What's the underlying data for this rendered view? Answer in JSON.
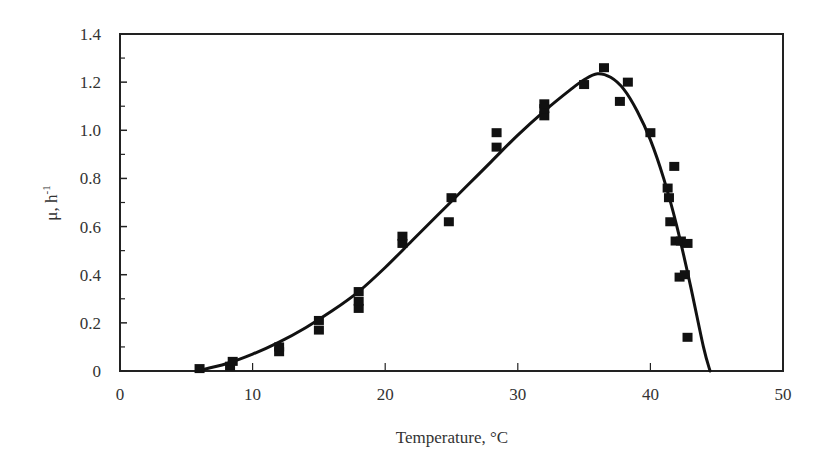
{
  "chart_data": {
    "type": "scatter",
    "title": "",
    "xlabel": "Temperature, °C",
    "ylabel": "μ, h",
    "ylabel_superscript": "-1",
    "xlim": [
      0,
      50
    ],
    "ylim": [
      0,
      1.4
    ],
    "x_ticks": [
      0,
      10,
      20,
      30,
      40,
      50
    ],
    "x_tick_labels": [
      "0",
      "10",
      "20",
      "30",
      "40",
      "50"
    ],
    "y_ticks": [
      0,
      0.2,
      0.4,
      0.6,
      0.8,
      1.0,
      1.2,
      1.4
    ],
    "y_tick_labels": [
      "0",
      "0.2",
      "0.4",
      "0.6",
      "0.8",
      "1.0",
      "1.2",
      "1.4"
    ],
    "grid": false,
    "legend": null,
    "series": [
      {
        "name": "Measured growth rate",
        "kind": "scatter",
        "marker": "square",
        "color": "#111111",
        "points": [
          [
            6.0,
            0.01
          ],
          [
            8.3,
            0.02
          ],
          [
            8.5,
            0.04
          ],
          [
            12.0,
            0.08
          ],
          [
            12.0,
            0.1
          ],
          [
            15.0,
            0.17
          ],
          [
            15.0,
            0.21
          ],
          [
            18.0,
            0.26
          ],
          [
            18.0,
            0.29
          ],
          [
            18.0,
            0.33
          ],
          [
            21.3,
            0.53
          ],
          [
            21.3,
            0.56
          ],
          [
            24.8,
            0.62
          ],
          [
            25.0,
            0.72
          ],
          [
            28.4,
            0.93
          ],
          [
            28.4,
            0.99
          ],
          [
            32.0,
            1.06
          ],
          [
            32.0,
            1.09
          ],
          [
            32.0,
            1.11
          ],
          [
            35.0,
            1.19
          ],
          [
            36.5,
            1.26
          ],
          [
            37.7,
            1.12
          ],
          [
            38.3,
            1.2
          ],
          [
            40.0,
            0.99
          ],
          [
            41.3,
            0.76
          ],
          [
            41.4,
            0.72
          ],
          [
            41.5,
            0.62
          ],
          [
            41.8,
            0.85
          ],
          [
            41.9,
            0.54
          ],
          [
            42.3,
            0.54
          ],
          [
            42.2,
            0.39
          ],
          [
            42.6,
            0.4
          ],
          [
            42.8,
            0.53
          ],
          [
            42.8,
            0.14
          ]
        ]
      },
      {
        "name": "Model fit",
        "kind": "line",
        "color": "#111111",
        "points": [
          [
            5.8,
            0.0
          ],
          [
            8,
            0.03
          ],
          [
            10,
            0.07
          ],
          [
            12,
            0.12
          ],
          [
            14,
            0.18
          ],
          [
            16,
            0.25
          ],
          [
            18,
            0.33
          ],
          [
            20,
            0.43
          ],
          [
            22,
            0.54
          ],
          [
            24,
            0.65
          ],
          [
            26,
            0.76
          ],
          [
            28,
            0.87
          ],
          [
            30,
            0.98
          ],
          [
            32,
            1.08
          ],
          [
            34,
            1.17
          ],
          [
            35,
            1.21
          ],
          [
            36,
            1.235
          ],
          [
            37,
            1.22
          ],
          [
            38,
            1.17
          ],
          [
            39,
            1.08
          ],
          [
            40,
            0.96
          ],
          [
            41,
            0.8
          ],
          [
            42,
            0.6
          ],
          [
            43,
            0.36
          ],
          [
            44,
            0.1
          ],
          [
            44.5,
            0.0
          ]
        ]
      }
    ]
  }
}
